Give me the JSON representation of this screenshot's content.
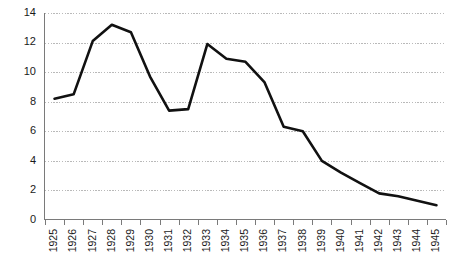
{
  "chart_data": {
    "type": "line",
    "title": "",
    "subtitle": "",
    "xlabel": "",
    "ylabel": "",
    "categories": [
      "1925",
      "1926",
      "1927",
      "1928",
      "1929",
      "1930",
      "1931",
      "1932",
      "1933",
      "1934",
      "1935",
      "1936",
      "1937",
      "1938",
      "1939",
      "1940",
      "1941",
      "1942",
      "1943",
      "1944",
      "1945"
    ],
    "values": [
      8.2,
      8.5,
      12.1,
      13.2,
      12.7,
      9.7,
      7.4,
      7.5,
      11.9,
      10.9,
      10.7,
      9.3,
      6.3,
      6.0,
      4.0,
      3.2,
      2.5,
      1.8,
      1.6,
      1.3,
      1.0
    ],
    "series": [
      {
        "name": "",
        "values": [
          8.2,
          8.5,
          12.1,
          13.2,
          12.7,
          9.7,
          7.4,
          7.5,
          11.9,
          10.9,
          10.7,
          9.3,
          6.3,
          6.0,
          4.0,
          3.2,
          2.5,
          1.8,
          1.6,
          1.3,
          1.0
        ]
      }
    ],
    "ylim": [
      0,
      14
    ],
    "xlim": [
      "1925",
      "1945"
    ],
    "yticks": [
      0,
      2,
      4,
      6,
      8,
      10,
      12,
      14
    ],
    "ytick_labels": [
      "0",
      "2",
      "4",
      "6",
      "8",
      "10",
      "12",
      "14"
    ],
    "grid": true,
    "grid_axis": "y",
    "legend": false,
    "legend_position": "none",
    "colors": {
      "line": "#111111",
      "grid": "#b9b9b9",
      "axis": "#7a7a7a",
      "text": "#1a1a1a",
      "background": "#ffffff"
    },
    "xtick_rotation": -90,
    "annotations": []
  }
}
